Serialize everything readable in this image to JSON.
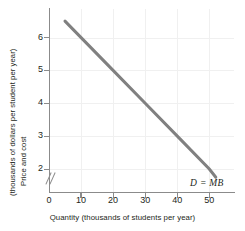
{
  "chart_data": {
    "type": "line",
    "title": "",
    "xlabel": "Quantity (thousands of students per year)",
    "ylabel_line1": "Price and cost",
    "ylabel_line2": "(thousands of dollars per student per year)",
    "xlim": [
      0,
      58
    ],
    "ylim": [
      1.3,
      6.9
    ],
    "xticks": [
      0,
      10,
      20,
      30,
      40,
      50
    ],
    "xtick_labels": [
      "0",
      "10",
      "20",
      "30",
      "40",
      "50"
    ],
    "yticks": [
      2,
      3,
      4,
      5,
      6
    ],
    "ytick_labels": [
      "2",
      "3",
      "4",
      "5",
      "6"
    ],
    "y_axis_break": true,
    "grid": true,
    "legend_position": "inline-right",
    "series": [
      {
        "name": "D = MB",
        "label": "D = MB",
        "color": "#808080",
        "x": [
          5,
          52
        ],
        "y": [
          6.5,
          1.75
        ],
        "points": [
          {
            "x": 5,
            "y": 6.5
          },
          {
            "x": 10,
            "y": 6.0
          },
          {
            "x": 20,
            "y": 5.0
          },
          {
            "x": 30,
            "y": 4.0
          },
          {
            "x": 40,
            "y": 3.0
          },
          {
            "x": 50,
            "y": 2.0
          },
          {
            "x": 52,
            "y": 1.75
          }
        ]
      }
    ],
    "annotations": [
      {
        "text": "D = MB",
        "x": 44,
        "y": 1.55,
        "style": "italic"
      }
    ],
    "colors": {
      "curve": "#808080",
      "axis": "#8b8b8b",
      "grid": "#f0f0f0",
      "text": "#231f20",
      "background": "#ffffff"
    }
  }
}
